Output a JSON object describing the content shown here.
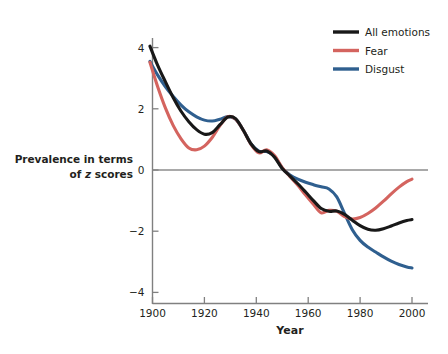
{
  "chart_data": {
    "type": "line",
    "title": "",
    "xlabel": "Year",
    "ylabel": "Prevalence in terms of z scores",
    "ylabel_line1": "Prevalence in terms",
    "ylabel_line2_pre": "of ",
    "ylabel_line2_italic": "z",
    "ylabel_line2_post": " scores",
    "xlim": [
      1898,
      2002
    ],
    "ylim": [
      -4.6,
      4.6
    ],
    "xticks": [
      1900,
      1920,
      1940,
      1960,
      1980,
      2000
    ],
    "xtick_labels": [
      "1900",
      "1920",
      "1940",
      "1960",
      "1980",
      "2000"
    ],
    "yticks": [
      4,
      2,
      0,
      -2,
      -4
    ],
    "ytick_labels": [
      "4",
      "2",
      "0",
      "−2",
      "−4"
    ],
    "grid": false,
    "zero_reference_line": true,
    "legend_position": "top-right",
    "colors": {
      "all_emotions": "#181818",
      "fear": "#d4645f",
      "disgust": "#2f5f8f",
      "axis": "#808080",
      "zero_line": "#8c8c8c",
      "text": "#231f20",
      "background": "#ffffff"
    },
    "series": [
      {
        "name": "All emotions",
        "color": "#181818",
        "x": [
          1899,
          1902,
          1905,
          1908,
          1911,
          1914,
          1917,
          1920,
          1923,
          1926,
          1929,
          1932,
          1935,
          1938,
          1941,
          1944,
          1947,
          1950,
          1953,
          1956,
          1959,
          1962,
          1965,
          1968,
          1971,
          1974,
          1977,
          1980,
          1983,
          1986,
          1989,
          1992,
          1995,
          1998,
          2000
        ],
        "values": [
          4.05,
          3.42,
          2.88,
          2.36,
          1.92,
          1.58,
          1.32,
          1.17,
          1.22,
          1.48,
          1.73,
          1.68,
          1.3,
          0.85,
          0.6,
          0.62,
          0.42,
          0.05,
          -0.2,
          -0.45,
          -0.72,
          -1.0,
          -1.26,
          -1.35,
          -1.34,
          -1.45,
          -1.64,
          -1.82,
          -1.94,
          -1.97,
          -1.92,
          -1.83,
          -1.73,
          -1.65,
          -1.62
        ]
      },
      {
        "name": "Fear",
        "color": "#d4645f",
        "x": [
          1899,
          1902,
          1905,
          1908,
          1911,
          1914,
          1917,
          1920,
          1923,
          1926,
          1929,
          1932,
          1935,
          1938,
          1941,
          1944,
          1947,
          1950,
          1953,
          1956,
          1959,
          1962,
          1965,
          1968,
          1971,
          1974,
          1977,
          1980,
          1983,
          1986,
          1989,
          1992,
          1995,
          1998,
          2000
        ],
        "values": [
          3.52,
          2.72,
          2.02,
          1.45,
          1.02,
          0.72,
          0.66,
          0.78,
          1.06,
          1.45,
          1.74,
          1.66,
          1.3,
          0.83,
          0.56,
          0.66,
          0.47,
          0.08,
          -0.22,
          -0.5,
          -0.82,
          -1.12,
          -1.4,
          -1.32,
          -1.35,
          -1.52,
          -1.6,
          -1.55,
          -1.42,
          -1.24,
          -1.02,
          -0.78,
          -0.56,
          -0.38,
          -0.3
        ]
      },
      {
        "name": "Disgust",
        "color": "#2f5f8f",
        "x": [
          1899,
          1902,
          1905,
          1908,
          1911,
          1914,
          1917,
          1920,
          1923,
          1926,
          1929,
          1932,
          1935,
          1938,
          1941,
          1944,
          1947,
          1950,
          1953,
          1956,
          1959,
          1962,
          1965,
          1968,
          1971,
          1974,
          1977,
          1980,
          1983,
          1986,
          1989,
          1992,
          1995,
          1998,
          2000
        ],
        "values": [
          3.55,
          3.1,
          2.72,
          2.4,
          2.12,
          1.9,
          1.74,
          1.63,
          1.6,
          1.66,
          1.74,
          1.66,
          1.3,
          0.85,
          0.62,
          0.6,
          0.45,
          0.06,
          -0.16,
          -0.3,
          -0.4,
          -0.48,
          -0.55,
          -0.62,
          -0.88,
          -1.42,
          -1.95,
          -2.3,
          -2.52,
          -2.68,
          -2.84,
          -2.98,
          -3.09,
          -3.17,
          -3.2
        ]
      }
    ]
  },
  "legend": {
    "items": [
      {
        "label": "All emotions",
        "color": "#181818"
      },
      {
        "label": "Fear",
        "color": "#d4645f"
      },
      {
        "label": "Disgust",
        "color": "#2f5f8f"
      }
    ]
  }
}
